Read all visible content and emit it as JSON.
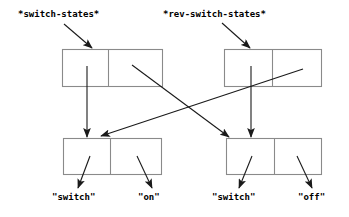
{
  "diagram": {
    "type": "cons-cell-pointer-diagram",
    "background_color": "#ffffff",
    "box_stroke_color": "#8a8a8a",
    "arrow_color": "#1a1a1a",
    "text_color": "#000000",
    "variables": [
      {
        "id": "var-switch-states",
        "label": "*switch-states*",
        "x": 18,
        "y": 17,
        "arrow": {
          "x1": 64,
          "y1": 24,
          "x2": 92,
          "y2": 48
        }
      },
      {
        "id": "var-rev-switch-states",
        "label": "*rev-switch-states*",
        "x": 163,
        "y": 17,
        "arrow": {
          "x1": 222,
          "y1": 23,
          "x2": 250,
          "y2": 48
        }
      }
    ],
    "cons_cells": [
      {
        "id": "cons-top-left",
        "x": 62,
        "y": 49,
        "width": 101,
        "height": 38,
        "divider_x": 108
      },
      {
        "id": "cons-top-right",
        "x": 224,
        "y": 49,
        "width": 98,
        "height": 38,
        "divider_x": 272
      },
      {
        "id": "cons-bottom-left",
        "x": 63,
        "y": 138,
        "width": 99,
        "height": 37,
        "divider_x": 110
      },
      {
        "id": "cons-bottom-right",
        "x": 226,
        "y": 138,
        "width": 96,
        "height": 37,
        "divider_x": 274
      }
    ],
    "pointers": [
      {
        "id": "ptr-topleft-car-to-bottomleft",
        "from": "cons-top-left.car",
        "to": "cons-bottom-left",
        "x1": 87,
        "y1": 66,
        "x2": 87,
        "y2": 137
      },
      {
        "id": "ptr-topleft-cdr-to-bottomright",
        "from": "cons-top-left.cdr",
        "to": "cons-bottom-right",
        "x1": 132,
        "y1": 65,
        "x2": 229,
        "y2": 137
      },
      {
        "id": "ptr-topright-car-to-bottomright",
        "from": "cons-top-right.car",
        "to": "cons-bottom-right",
        "x1": 251,
        "y1": 66,
        "x2": 251,
        "y2": 137
      },
      {
        "id": "ptr-topright-cdr-to-bottomleft",
        "from": "cons-top-right.cdr",
        "to": "cons-bottom-left",
        "x1": 303,
        "y1": 69,
        "x2": 101,
        "y2": 136
      }
    ],
    "atom_labels": [
      {
        "id": "atom-bottom-left-car",
        "label": "\"switch\"",
        "x": 52,
        "y": 200,
        "arrow": {
          "x1": 90,
          "y1": 156,
          "x2": 78,
          "y2": 188
        }
      },
      {
        "id": "atom-bottom-left-cdr",
        "label": "\"on\"",
        "x": 138,
        "y": 200,
        "arrow": {
          "x1": 137,
          "y1": 156,
          "x2": 152,
          "y2": 188
        }
      },
      {
        "id": "atom-bottom-right-car",
        "label": "\"switch\"",
        "x": 212,
        "y": 200,
        "arrow": {
          "x1": 252,
          "y1": 156,
          "x2": 239,
          "y2": 188
        }
      },
      {
        "id": "atom-bottom-right-cdr",
        "label": "\"off\"",
        "x": 298,
        "y": 200,
        "arrow": {
          "x1": 297,
          "y1": 156,
          "x2": 312,
          "y2": 188
        }
      }
    ]
  }
}
